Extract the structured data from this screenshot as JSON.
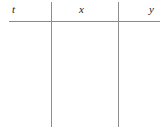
{
  "document": {
    "type": "table",
    "description": "Empty three-column data table skeleton",
    "background_color": "#ffffff",
    "rule_color": "#8a8a8a",
    "text_color": "#1a1a1a"
  },
  "table": {
    "column_count": 3,
    "row_count": 0,
    "headers": [
      {
        "label": "t",
        "style": "italic"
      },
      {
        "label": "x",
        "style": "italic"
      },
      {
        "label": "y",
        "style": "italic"
      }
    ],
    "rows": [],
    "body_cells": [
      {
        "column": "t",
        "value": ""
      },
      {
        "column": "x",
        "value": ""
      },
      {
        "column": "y",
        "value": ""
      }
    ]
  }
}
